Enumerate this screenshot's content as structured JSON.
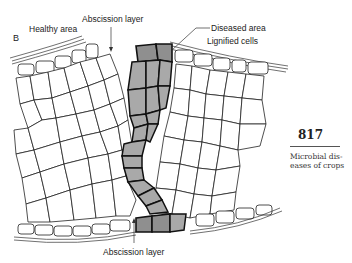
{
  "figure": {
    "panel_letter": "B",
    "labels": {
      "healthy_area": "Healthy area",
      "abscission_layer_top": "Abscission layer",
      "diseased_area": "Diseased area",
      "lignified_cells": "Lignified cells",
      "abscission_layer_bottom": "Abscission layer"
    }
  },
  "page": {
    "number": "817",
    "caption_line1": "Microbial dis-",
    "caption_line2": "eases of crops"
  },
  "colors": {
    "diseased_fill": "#a9a9a9",
    "outline": "#222222",
    "background": "#ffffff"
  }
}
